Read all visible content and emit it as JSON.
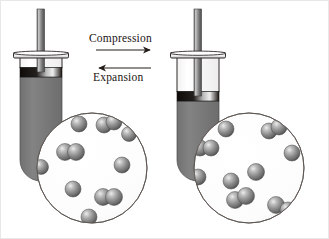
{
  "figure": {
    "background": "#ffffff",
    "width": 329,
    "height": 239,
    "border_color": "#e8e8e8"
  },
  "labels": {
    "compression": "Compression",
    "expansion": "Expansion"
  },
  "arrows": {
    "compression": {
      "direction": "right",
      "x1": 96,
      "y1": 50,
      "x2": 153,
      "y2": 50
    },
    "expansion": {
      "direction": "left",
      "x1": 153,
      "y1": 68,
      "x2": 96,
      "y2": 68
    },
    "color": "#231c18"
  },
  "colors": {
    "gas_body": "#7d7d7d",
    "gas_body_dark": "#6e6e6e",
    "barrel_glass": "#fdfdfd",
    "outline": "#3a332f",
    "seal_dark": "#17120f",
    "seal_light": "#efefef",
    "rod_light": "#d8d8d8",
    "rod_dark": "#5a5a5a",
    "molecule_fill": "#7f7f7f",
    "molecule_dark": "#4c4c4c",
    "molecule_highlight": "#e9e9e9",
    "circle_fill": "#fbfbfb",
    "circle_stroke": "#5c5550"
  },
  "syringes": [
    {
      "name": "left-syringe",
      "state": "expanded",
      "caption": "Gas at lower pressure, larger volume",
      "barrel": {
        "x": 20,
        "y": 55,
        "w": 42,
        "h": 125,
        "bottom_radius": 20
      },
      "flange": {
        "x": 14,
        "y": 53,
        "w": 54,
        "h": 6
      },
      "rod": {
        "x": 37,
        "y": 9,
        "w": 7,
        "h": 63
      },
      "seal": {
        "x": 20,
        "y": 68,
        "w": 42,
        "h": 9
      },
      "gas_top_y": 77
    },
    {
      "name": "right-syringe",
      "state": "compressed",
      "caption": "Gas at higher pressure, smaller volume",
      "barrel": {
        "x": 177,
        "y": 55,
        "w": 42,
        "h": 125,
        "bottom_radius": 20
      },
      "flange": {
        "x": 171,
        "y": 53,
        "w": 54,
        "h": 6
      },
      "rod": {
        "x": 194,
        "y": 9,
        "w": 7,
        "h": 90
      },
      "seal": {
        "x": 177,
        "y": 92,
        "w": 42,
        "h": 9
      },
      "gas_top_y": 101
    }
  ],
  "magnifiers": [
    {
      "name": "left-magnifier",
      "for": "left-syringe",
      "cx": 92,
      "cy": 168,
      "r": 55,
      "particle_count": 18,
      "description": "Gas particles spread far apart (low density)",
      "molecules": [
        {
          "type": "single",
          "x": 79,
          "y": 124,
          "r": 8.0
        },
        {
          "type": "pair",
          "x": 104,
          "y": 124,
          "r": 8.0,
          "x2": 113,
          "y2": 122,
          "r2": 8.0
        },
        {
          "type": "single",
          "x": 128,
          "y": 133,
          "r": 7.5
        },
        {
          "type": "pair",
          "x": 65,
          "y": 152,
          "r": 8.5,
          "x2": 76,
          "y2": 152,
          "r2": 8.5
        },
        {
          "type": "single",
          "x": 41,
          "y": 166,
          "r": 7.5
        },
        {
          "type": "single",
          "x": 121,
          "y": 165,
          "r": 8.0
        },
        {
          "type": "single",
          "x": 73,
          "y": 188,
          "r": 8.0
        },
        {
          "type": "pair",
          "x": 103,
          "y": 196,
          "r": 8.5,
          "x2": 114,
          "y2": 196,
          "r2": 8.5
        },
        {
          "type": "single",
          "x": 89,
          "y": 216,
          "r": 8.0
        }
      ]
    },
    {
      "name": "right-magnifier",
      "for": "right-syringe",
      "cx": 249,
      "cy": 168,
      "r": 55,
      "particle_count": 18,
      "description": "Gas particles packed closer together (high density)",
      "molecules": [
        {
          "type": "single",
          "x": 226,
          "y": 128,
          "r": 8.0
        },
        {
          "type": "pair",
          "x": 268,
          "y": 130,
          "r": 8.0,
          "x2": 278,
          "y2": 126,
          "r2": 8.0
        },
        {
          "type": "pair",
          "x": 200,
          "y": 148,
          "r": 8.0,
          "x2": 210,
          "y2": 148,
          "r2": 8.0
        },
        {
          "type": "single",
          "x": 291,
          "y": 152,
          "r": 8.0
        },
        {
          "type": "single",
          "x": 198,
          "y": 176,
          "r": 8.0
        },
        {
          "type": "single",
          "x": 255,
          "y": 172,
          "r": 8.5
        },
        {
          "type": "single",
          "x": 231,
          "y": 180,
          "r": 8.0
        },
        {
          "type": "pair",
          "x": 235,
          "y": 199,
          "r": 8.5,
          "x2": 246,
          "y2": 196,
          "r2": 8.5
        },
        {
          "type": "pair",
          "x": 276,
          "y": 204,
          "r": 8.5,
          "x2": 288,
          "y2": 209,
          "r2": 8.0
        }
      ]
    }
  ]
}
